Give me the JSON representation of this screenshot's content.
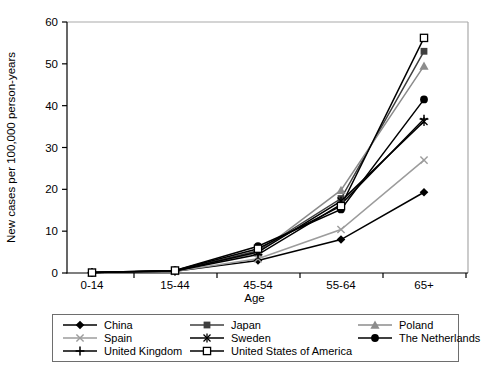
{
  "figure": {
    "background": "#ffffff",
    "plot_border_color": "#a9a9a9",
    "axis_color": "#000000"
  },
  "chart_data": {
    "type": "line",
    "title": "",
    "xlabel": "Age",
    "ylabel": "New cases per 100,000 person-years",
    "categories": [
      "0-14",
      "15-44",
      "45-54",
      "55-64",
      "65+"
    ],
    "ylim": [
      0,
      60
    ],
    "yticks": [
      0,
      10,
      20,
      30,
      40,
      50,
      60
    ],
    "grid": false,
    "legend_position": "bottom",
    "series": [
      {
        "name": "China",
        "marker": "diamond",
        "color": "#000000",
        "values": [
          0.1,
          0.4,
          3.0,
          8.0,
          19.3
        ]
      },
      {
        "name": "Japan",
        "marker": "square",
        "color": "#3f3f3f",
        "values": [
          0.1,
          0.5,
          5.3,
          17.8,
          53.0
        ]
      },
      {
        "name": "Poland",
        "marker": "triangle",
        "color": "#8c8c8c",
        "values": [
          0.1,
          0.5,
          4.8,
          19.8,
          49.5
        ]
      },
      {
        "name": "Spain",
        "marker": "x",
        "color": "#9c9c9c",
        "values": [
          0.1,
          0.4,
          3.4,
          10.4,
          27.0
        ]
      },
      {
        "name": "Sweden",
        "marker": "asterisk",
        "color": "#000000",
        "values": [
          0.1,
          0.5,
          5.0,
          17.2,
          36.2
        ]
      },
      {
        "name": "The Netherlands",
        "marker": "circle",
        "color": "#000000",
        "values": [
          0.1,
          0.6,
          6.4,
          15.2,
          41.5
        ]
      },
      {
        "name": "United Kingdom",
        "marker": "plus",
        "color": "#000000",
        "values": [
          0.1,
          0.5,
          4.4,
          16.4,
          36.8
        ]
      },
      {
        "name": "United States of America",
        "marker": "open-square",
        "color": "#000000",
        "values": [
          0.1,
          0.6,
          5.8,
          16.0,
          56.2
        ]
      }
    ]
  }
}
